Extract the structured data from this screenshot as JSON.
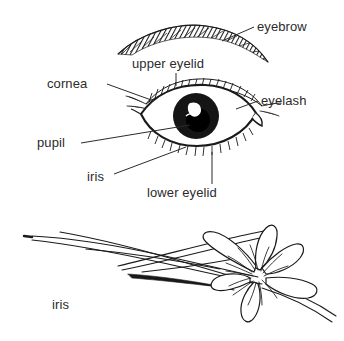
{
  "figure": {
    "background_color": "#ffffff",
    "ink_color": "#1a1a1a",
    "text_color": "#2b2b2b"
  },
  "diagrams": [
    {
      "name": "human-eye",
      "description": "Line drawing of a human eye with eyebrow, eyelashes, iris and pupil",
      "labels": [
        {
          "id": "eyebrow",
          "text": "eyebrow",
          "leader": "diagonal-left-down"
        },
        {
          "id": "upper-eyelid",
          "text": "upper eyelid",
          "leader": "vertical-down"
        },
        {
          "id": "cornea",
          "text": "cornea",
          "leader": "diagonal-right-down"
        },
        {
          "id": "eyelash",
          "text": "eyelash",
          "leader": "diagonal-left-down"
        },
        {
          "id": "pupil",
          "text": "pupil",
          "leader": "horizontal-right"
        },
        {
          "id": "iris",
          "text": "iris",
          "leader": "diagonal-right-up"
        },
        {
          "id": "lower-eyelid",
          "text": "lower eyelid",
          "leader": "vertical-up"
        }
      ]
    },
    {
      "name": "iris-flower",
      "description": "Line drawing of an iris flower with long sword-shaped leaves",
      "labels": [
        {
          "id": "iris-flower",
          "text": "iris",
          "leader": "none"
        }
      ]
    }
  ]
}
